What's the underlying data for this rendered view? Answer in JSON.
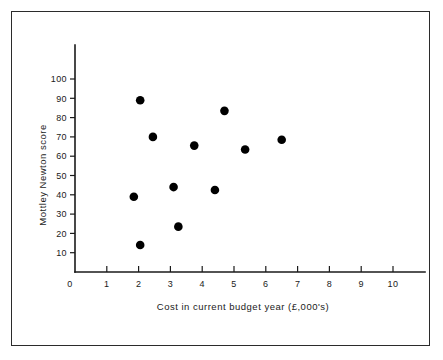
{
  "chart_data": {
    "type": "scatter",
    "title": "",
    "subtitle": "",
    "xlabel": "Cost in current budget year (£,000's)",
    "ylabel": "Mottley Newton score",
    "xlim": [
      0,
      11.1
    ],
    "ylim": [
      0,
      112
    ],
    "xticks": [
      0,
      1,
      2,
      3,
      4,
      5,
      6,
      7,
      8,
      9,
      10
    ],
    "xtick_labels": [
      "0",
      "1",
      "2",
      "3",
      "4",
      "5",
      "6",
      "7",
      "8",
      "9",
      "10"
    ],
    "yticks": [
      10,
      20,
      30,
      40,
      50,
      60,
      70,
      80,
      90,
      100
    ],
    "ytick_labels": [
      "10",
      "20",
      "30",
      "40",
      "50",
      "60",
      "70",
      "80",
      "90",
      "100"
    ],
    "y_origin_label": "0",
    "grid": false,
    "legend": null,
    "legend_position": "none",
    "marker": "filled-circle",
    "marker_color": "#000000",
    "marker_size": 4.3,
    "points": [
      {
        "x": 2.05,
        "y": 89.0
      },
      {
        "x": 2.45,
        "y": 70.0
      },
      {
        "x": 1.85,
        "y": 39.0
      },
      {
        "x": 2.05,
        "y": 14.0
      },
      {
        "x": 3.1,
        "y": 44.0
      },
      {
        "x": 3.25,
        "y": 23.5
      },
      {
        "x": 3.75,
        "y": 65.5
      },
      {
        "x": 4.4,
        "y": 42.5
      },
      {
        "x": 4.7,
        "y": 83.5
      },
      {
        "x": 5.35,
        "y": 63.5
      },
      {
        "x": 6.5,
        "y": 68.5
      }
    ],
    "point_count": 11,
    "annotations": []
  },
  "figure": {
    "background_color": "#ffffff",
    "ink_color": "#1a1a1a",
    "border_color": "#2b2b2b"
  }
}
